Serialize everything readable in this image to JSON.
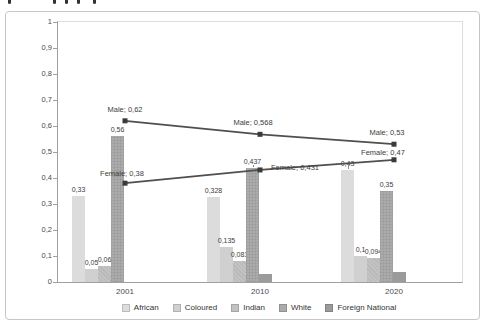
{
  "chart_data": {
    "type": "bar",
    "subtype": "clustered-bars-with-line-overlay",
    "title": "",
    "xlabel": "",
    "ylabel": "",
    "categories": [
      "2001",
      "2010",
      "2020"
    ],
    "series": [
      {
        "name": "African",
        "color": "#dcdcdc",
        "pattern": "none",
        "values": [
          0.33,
          0.328,
          0.43
        ],
        "labels": [
          "0,33",
          "0,328",
          "0,43"
        ]
      },
      {
        "name": "Coloured",
        "color": "#d0d0d0",
        "pattern": "none",
        "values": [
          0.05,
          0.135,
          0.1
        ],
        "labels": [
          "0,05",
          "0,135",
          "0,1"
        ]
      },
      {
        "name": "Indian",
        "color": "#c2c2c2",
        "pattern": "cross",
        "values": [
          0.06,
          0.081,
          0.094
        ],
        "labels": [
          "0,06",
          "0,081",
          "0,094"
        ]
      },
      {
        "name": "White",
        "color": "#ababab",
        "pattern": "dots",
        "values": [
          0.56,
          0.437,
          0.35
        ],
        "labels": [
          "0,56",
          "0,437",
          "0,35"
        ]
      },
      {
        "name": "Foreign National",
        "color": "#9b9b9b",
        "pattern": "none",
        "values": [
          0,
          0.03,
          0.04
        ],
        "labels": [
          "",
          "",
          ""
        ]
      }
    ],
    "line_series": [
      {
        "name": "Male",
        "color": "#4f4f4f",
        "marker": "square",
        "values": [
          0.62,
          0.568,
          0.53
        ],
        "labels": [
          "Male; 0,62",
          "Male; 0,568",
          "Male; 0,53"
        ]
      },
      {
        "name": "Female",
        "color": "#4f4f4f",
        "marker": "square",
        "values": [
          0.38,
          0.431,
          0.47
        ],
        "labels": [
          "Female; 0,38",
          "Female; 0,431",
          "Female; 0,47"
        ]
      }
    ],
    "ylim": [
      0,
      1
    ],
    "ytick_labels": [
      "1",
      "0,9",
      "0,8",
      "0,7",
      "0,6",
      "0,5",
      "0,4",
      "0,3",
      "0,2",
      "0,1",
      "0"
    ],
    "decimal_separator": ",",
    "grid": false,
    "legend_position": "bottom",
    "legend_entries": [
      "African",
      "Coloured",
      "Indian",
      "White",
      "Foreign National"
    ]
  }
}
